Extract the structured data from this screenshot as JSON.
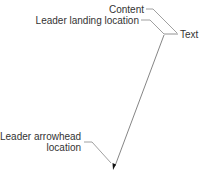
{
  "diagram": {
    "labels": {
      "content": "Content",
      "leader_landing": "Leader landing location",
      "text": "Text",
      "arrowhead_line1": "Leader arrowhead",
      "arrowhead_line2": "location"
    },
    "colors": {
      "line": "#777777",
      "leader": "#555555",
      "text": "#333333",
      "arrowhead": "#111111"
    }
  }
}
